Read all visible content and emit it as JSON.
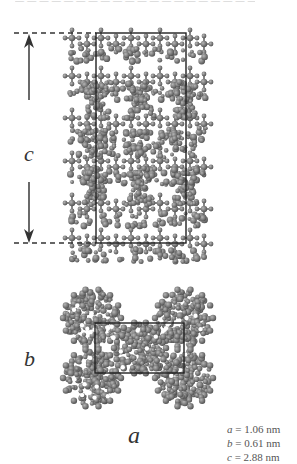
{
  "figure": {
    "top_caption_fragment": "— — — — — — — — — — — — — — — — — — — —",
    "side_view": {
      "axis_label": "c",
      "arrow_up": "arrow-up",
      "arrow_down": "arrow-down",
      "cell_box": {
        "x": 96,
        "y": 33,
        "width": 90,
        "height": 210
      },
      "dashed_lines_y": [
        33,
        243
      ]
    },
    "end_view": {
      "axis_label": "b",
      "cell_box": {
        "x": 95,
        "y": 323,
        "width": 89,
        "height": 50
      }
    },
    "bottom_axis_label": "a",
    "lattice_parameters": [
      {
        "symbol": "a",
        "value": "= 1.06 nm"
      },
      {
        "symbol": "b",
        "value": "= 0.61 nm"
      },
      {
        "symbol": "c",
        "value": "= 2.88 nm"
      }
    ],
    "colors": {
      "atom_fill": "#7a7a7a",
      "atom_highlight": "#a8a8a8",
      "atom_shadow": "#555555",
      "box_line": "#222222",
      "arrow": "#444444"
    }
  }
}
